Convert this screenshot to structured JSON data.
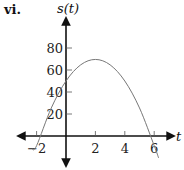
{
  "figure_label": "vi.",
  "chart_data": {
    "type": "line",
    "title": "",
    "xlabel": "t",
    "ylabel": "s(t)",
    "x_ticks": [
      -2,
      2,
      4,
      6
    ],
    "y_ticks": [
      20,
      40,
      60,
      80
    ],
    "xlim": [
      -4.3,
      7.5
    ],
    "ylim": [
      -35,
      100
    ],
    "grid": false,
    "series": [
      {
        "name": "s(t)",
        "description": "downward parabola, vertex near (2, 70), y-intercept ~50, roots ~ -1.8 and ~5.8",
        "x": [
          -2.3,
          -2,
          -1,
          0,
          1,
          2,
          3,
          4,
          5,
          6,
          6.3
        ],
        "values": [
          -12.1,
          -8.8,
          25.5,
          50,
          64.7,
          69.6,
          64.7,
          50,
          25.5,
          -8.8,
          -19.9
        ]
      }
    ]
  }
}
